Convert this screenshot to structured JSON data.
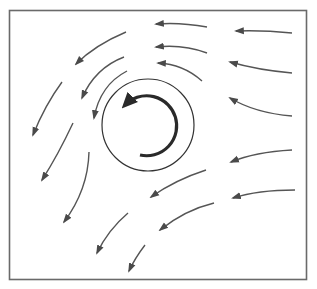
{
  "diagram": {
    "title": "",
    "colors": {
      "background": "#ffffff",
      "frame": "#6a6a6a",
      "streamline": "#555555",
      "circle": "#333333",
      "rotation_arrow": "#2a2a2a"
    },
    "frame": {
      "x": 9,
      "y": 10,
      "width": 298,
      "height": 270
    },
    "body_circle": {
      "cx": 148,
      "cy": 125,
      "r": 46
    },
    "rotation_arrow": {
      "direction": "counter-clockwise",
      "cx": 148,
      "cy": 125,
      "r": 30
    },
    "streamlines": [
      {
        "id": "s1",
        "path": "M292,33 Q262,30 236,31"
      },
      {
        "id": "s2",
        "path": "M292,73 Q258,70 230,62"
      },
      {
        "id": "s3",
        "path": "M292,116 Q255,113 230,98"
      },
      {
        "id": "s4",
        "path": "M207,27 Q180,22 156,24"
      },
      {
        "id": "s5",
        "path": "M207,53 Q183,44 156,47"
      },
      {
        "id": "s6",
        "path": "M202,81 Q183,64 158,63"
      },
      {
        "id": "s7",
        "path": "M126,32 Q95,45 76,64"
      },
      {
        "id": "s8",
        "path": "M124,57 Q95,68 82,98"
      },
      {
        "id": "s9",
        "path": "M127,71 Q100,85 94,118"
      },
      {
        "id": "s10",
        "path": "M62,82 Q45,105 33,135"
      },
      {
        "id": "s11",
        "path": "M73,123 Q58,155 42,180"
      },
      {
        "id": "s12",
        "path": "M89,152 Q88,190 64,222"
      },
      {
        "id": "s13",
        "path": "M292,150 Q255,152 231,162"
      },
      {
        "id": "s14",
        "path": "M295,190 Q258,190 233,198"
      },
      {
        "id": "s15",
        "path": "M206,170 Q175,180 151,197"
      },
      {
        "id": "s16",
        "path": "M214,203 Q185,210 160,230"
      },
      {
        "id": "s17",
        "path": "M128,213 Q108,230 97,253"
      },
      {
        "id": "s18",
        "path": "M145,245 Q135,258 129,271"
      }
    ]
  }
}
